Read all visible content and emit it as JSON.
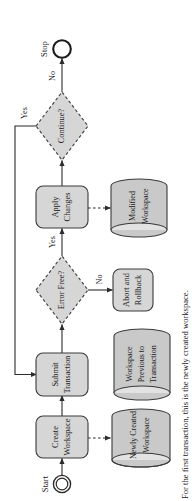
{
  "figure": {
    "type": "flowchart",
    "orientation": "rotated-90-ccw",
    "caption": "For the first transaction, this is the newly created workspace."
  },
  "colors": {
    "shape_fill": "#d6d6d6",
    "shape_stroke": "#3a3a3a",
    "cylinder_fill": "#c9c9c9",
    "cylinder_top_fill": "#e2e2e2",
    "line": "#2b2b2b",
    "text": "#1a1a1a",
    "background": "#ffffff"
  },
  "nodes": {
    "start": {
      "label": "Start",
      "shape": "start-terminator"
    },
    "create_workspace": {
      "line1": "Create",
      "line2": "Workspace",
      "shape": "process"
    },
    "submit_transaction": {
      "line1": "Submit",
      "line2": "Transaction",
      "shape": "process"
    },
    "error_free": {
      "label": "Error Free?",
      "shape": "decision",
      "border": "dashed"
    },
    "apply_changes": {
      "line1": "Apply",
      "line2": "Changes",
      "shape": "process"
    },
    "continue": {
      "label": "Continue?",
      "shape": "decision",
      "border": "dashed"
    },
    "stop": {
      "label": "Stop",
      "shape": "end-terminator"
    },
    "abort_rollback": {
      "line1": "Abort and",
      "line2": "Rollback",
      "shape": "process"
    },
    "newly_created_workspace": {
      "line1": "Newly Created",
      "line2": "Workspace",
      "shape": "datastore"
    },
    "workspace_previous": {
      "line1": "Workspace",
      "line2": "Previous to",
      "line3": "Transaction",
      "shape": "datastore"
    },
    "modified_workspace": {
      "line1": "Modified",
      "line2": "Workspace",
      "shape": "datastore"
    }
  },
  "edges": [
    {
      "from": "start",
      "to": "create_workspace",
      "label": "",
      "style": "solid"
    },
    {
      "from": "create_workspace",
      "to": "submit_transaction",
      "label": "",
      "style": "solid"
    },
    {
      "from": "submit_transaction",
      "to": "error_free",
      "label": "",
      "style": "solid"
    },
    {
      "from": "error_free",
      "to": "apply_changes",
      "label": "Yes",
      "style": "solid"
    },
    {
      "from": "error_free",
      "to": "abort_rollback",
      "label": "No",
      "style": "solid"
    },
    {
      "from": "apply_changes",
      "to": "continue",
      "label": "",
      "style": "solid"
    },
    {
      "from": "continue",
      "to": "stop",
      "label": "No",
      "style": "solid"
    },
    {
      "from": "continue",
      "to": "submit_transaction",
      "label": "Yes",
      "style": "solid"
    },
    {
      "from": "create_workspace",
      "to": "newly_created_workspace",
      "label": "",
      "style": "dashed"
    },
    {
      "from": "abort_rollback",
      "to": "workspace_previous",
      "label": "",
      "style": "dashed"
    },
    {
      "from": "apply_changes",
      "to": "modified_workspace",
      "label": "",
      "style": "dashed"
    },
    {
      "from": "workspace_previous",
      "to": "caption",
      "label": "",
      "style": "dashed"
    }
  ],
  "edge_labels": {
    "error_free_yes": "Yes",
    "error_free_no": "No",
    "continue_no": "No",
    "continue_yes": "Yes"
  }
}
